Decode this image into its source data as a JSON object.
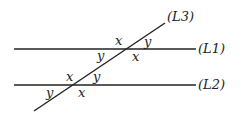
{
  "diagram": {
    "lines": [
      {
        "id": "L1",
        "label": "(L1)",
        "x1": 14,
        "y1": 49,
        "x2": 196,
        "y2": 49
      },
      {
        "id": "L2",
        "label": "(L2)",
        "x1": 14,
        "y1": 85,
        "x2": 196,
        "y2": 85
      },
      {
        "id": "L3",
        "label": "(L3)",
        "x1": 34,
        "y1": 111,
        "x2": 165,
        "y2": 23
      }
    ],
    "angles": {
      "l1_above_left": "x",
      "l1_above_right": "y",
      "l1_below_left": "y",
      "l1_below_right": "x",
      "l2_above_left": "x",
      "l2_above_right": "y",
      "l2_below_left": "y",
      "l2_below_right": "x"
    },
    "colors": {
      "stroke": "#222222",
      "background": "#ffffff"
    }
  }
}
